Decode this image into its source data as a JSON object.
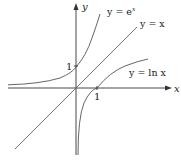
{
  "diagram": {
    "axes": {
      "x_label": "x",
      "y_label": "y"
    },
    "ticks": {
      "x_one": "1",
      "y_one": "1"
    },
    "curves": [
      {
        "name": "exp",
        "label": "y = e",
        "sup": "x"
      },
      {
        "name": "identity",
        "label": "y = x"
      },
      {
        "name": "ln",
        "label": "y = ln x"
      }
    ],
    "colors": {
      "axis": "#333333",
      "curve": "#555555"
    }
  }
}
